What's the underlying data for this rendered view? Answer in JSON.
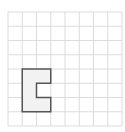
{
  "grid": {
    "cols": 8,
    "rows": 8,
    "origin_x": 8,
    "origin_y": 12,
    "cell": 14.25,
    "line_color": "#dcdcdc",
    "border_color": "#e2e2e2"
  },
  "shape": {
    "name": "c-shape",
    "fill": "#f2f2f2",
    "stroke": "#555555",
    "cells_path": [
      [
        1,
        4
      ],
      [
        3,
        4
      ],
      [
        3,
        5
      ],
      [
        2,
        5
      ],
      [
        2,
        6
      ],
      [
        3,
        6
      ],
      [
        3,
        7
      ],
      [
        1,
        7
      ]
    ]
  }
}
